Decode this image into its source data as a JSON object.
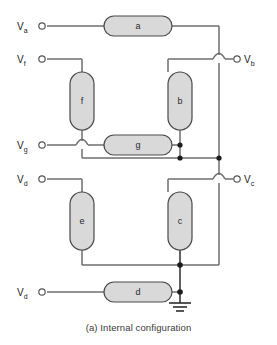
{
  "figure": {
    "caption": "(a) Internal configuration",
    "title": "Internal configuration",
    "type": "circuit-schematic"
  },
  "colors": {
    "background": "#ffffff",
    "wire": "#6e6e6e",
    "wire_dark": "#3a3a3a",
    "box_fill": "#d9d9d9",
    "box_stroke": "#4a4a4a",
    "node_dot": "#1c1c1c",
    "terminal_stroke": "#555555",
    "text": "#222222",
    "caption_text": "#3a3a3a"
  },
  "segments": {
    "labels": {
      "a": "a",
      "b": "b",
      "c": "c",
      "d": "d",
      "e": "e",
      "f": "f",
      "g": "g"
    },
    "list": [
      {
        "id": "a",
        "label": "a",
        "orientation": "horizontal",
        "x": 104,
        "y": 16,
        "w": 68,
        "h": 20
      },
      {
        "id": "f",
        "label": "f",
        "orientation": "vertical",
        "x": 70,
        "y": 72,
        "w": 24,
        "h": 58
      },
      {
        "id": "b",
        "label": "b",
        "orientation": "vertical",
        "x": 168,
        "y": 72,
        "w": 24,
        "h": 58
      },
      {
        "id": "g",
        "label": "g",
        "orientation": "horizontal",
        "x": 104,
        "y": 135,
        "w": 68,
        "h": 20
      },
      {
        "id": "e",
        "label": "e",
        "orientation": "vertical",
        "x": 70,
        "y": 192,
        "w": 24,
        "h": 58
      },
      {
        "id": "c",
        "label": "c",
        "orientation": "vertical",
        "x": 168,
        "y": 192,
        "w": 24,
        "h": 58
      },
      {
        "id": "d",
        "label": "d",
        "orientation": "horizontal",
        "x": 104,
        "y": 282,
        "w": 68,
        "h": 20
      }
    ]
  },
  "terminals": {
    "left": [
      {
        "id": "Va",
        "base": "V",
        "sub": "a",
        "label": "Va",
        "x": 34,
        "y": 26
      },
      {
        "id": "Vf",
        "base": "V",
        "sub": "f",
        "label": "Vf",
        "x": 34,
        "y": 59
      },
      {
        "id": "Vg",
        "base": "V",
        "sub": "g",
        "label": "Vg",
        "x": 34,
        "y": 145
      },
      {
        "id": "Vd_upper",
        "base": "V",
        "sub": "d",
        "label": "Vd",
        "x": 34,
        "y": 179
      },
      {
        "id": "Vd_lower",
        "base": "V",
        "sub": "d",
        "label": "Vd",
        "x": 34,
        "y": 292
      }
    ],
    "right": [
      {
        "id": "Vb",
        "base": "V",
        "sub": "b",
        "label": "Vb",
        "x": 240,
        "y": 59
      },
      {
        "id": "Vc",
        "base": "V",
        "sub": "c",
        "label": "Vc",
        "x": 240,
        "y": 179
      }
    ]
  },
  "nodes": [
    {
      "id": "node-g-right",
      "x": 180,
      "y": 145
    },
    {
      "id": "node-bus-mid-b",
      "x": 180,
      "y": 158
    },
    {
      "id": "node-bus-mid-right",
      "x": 219,
      "y": 158
    },
    {
      "id": "node-bottom-bus",
      "x": 180,
      "y": 265
    },
    {
      "id": "node-ground",
      "x": 180,
      "y": 292
    }
  ],
  "ground": {
    "id": "ground-symbol",
    "x": 180,
    "y": 302,
    "bars": 3
  }
}
